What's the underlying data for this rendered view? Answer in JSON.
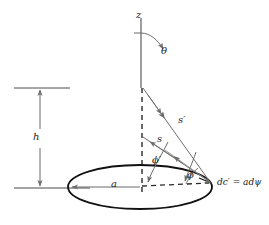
{
  "figure": {
    "background_color": "#ffffff",
    "line_color": "#6b6b6b",
    "heavy_line_color": "#111111",
    "text_color": "#1a1a1a",
    "width": 269,
    "height": 225
  },
  "labels": {
    "z_axis": "z",
    "theta_angle": "θ",
    "height": "h",
    "radius": "a",
    "vector_s": "s",
    "vector_s_prime": "s′",
    "phi_prime_angle": "ϕ′",
    "phi_angle": "ϕ",
    "element_equation": "dc′ = adψ"
  },
  "geometry": {
    "z_axis": {
      "x": 141,
      "y_top": 18,
      "y_bottom": 188
    },
    "ellipse": {
      "cx": 140,
      "cy": 187,
      "rx": 72,
      "ry": 22
    },
    "apex_point": {
      "x": 210,
      "y": 182
    },
    "source_top": {
      "x": 143,
      "y": 88
    },
    "source_mid": {
      "x": 143,
      "y": 137
    },
    "height_dimension": {
      "x": 40,
      "y_top": 88,
      "y_bottom": 188
    },
    "tick_top": {
      "x1": 14,
      "x2": 70,
      "y": 88
    },
    "tick_bottom": {
      "x1": 14,
      "x2": 70,
      "y": 188
    },
    "radius_arrow": {
      "x_from": 140,
      "x_to": 70,
      "y": 187
    }
  }
}
